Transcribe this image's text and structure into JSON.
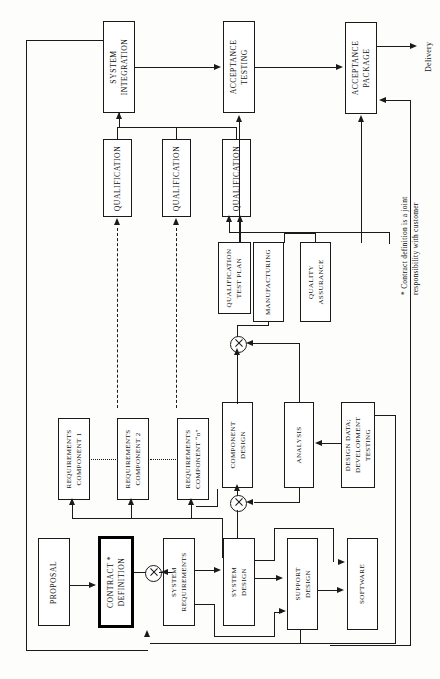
{
  "diagram": {
    "orientation": "rotated-90",
    "delivery_label": "Delivery",
    "footnote": "* Contract definition is a joint\nresponsibility with customer",
    "nodes": {
      "proposal": "PROPOSAL",
      "contract_definition": "CONTRACT *\nDEFINITION",
      "system_requirements": "SYSTEM\nREQUIREMENTS",
      "system_design": "SYSTEM\nDESIGN",
      "support_design": "SUPPORT\nDESIGN",
      "software": "SOFTWARE",
      "requirements_component_1": "REQUIREMENTS\nCOMPONENT 1",
      "requirements_component_2": "REQUIREMENTS\nCOMPONENT 2",
      "requirements_component_n": "REQUIREMENTS\nCOMPONENT “n”",
      "component_design": "COMPONENT\nDESIGN",
      "analysis": "ANALYSIS",
      "design_data": "DESIGN DATA;\nDEVELOPMENT\nTESTING",
      "qualification_1": "QUALIFICATION",
      "qualification_2": "QUALIFICATION",
      "qualification_n": "QUALIFICATION",
      "qualification_test_plan": "QUALIFICATION\nTEST PLAN",
      "manufacturing": "MANUFACTURING",
      "quality_assurance": "QUALITY\nASSURANCE",
      "system_integration": "SYSTEM\nINTEGRATION",
      "acceptance_testing": "ACCEPTANCE\nTESTING",
      "acceptance_package": "ACCEPTANCE\nPACKAGE"
    },
    "colors": {
      "line": "#1a1a1a",
      "box_fill": "#ffffff",
      "page": "#fdfdfb"
    }
  }
}
